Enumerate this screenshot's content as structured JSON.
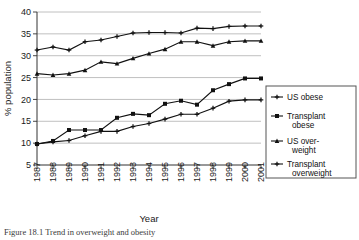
{
  "chart_data": {
    "type": "line",
    "title": "",
    "xlabel": "Year",
    "ylabel": "% population",
    "xlim": [
      1987,
      2001
    ],
    "ylim": [
      5,
      40
    ],
    "ytick_step": 5,
    "grid": true,
    "legend_position": "right",
    "x": [
      1987,
      1988,
      1989,
      1990,
      1991,
      1992,
      1993,
      1994,
      1995,
      1996,
      1997,
      1998,
      1999,
      2000,
      2001
    ],
    "categories": [
      "1987",
      "1988",
      "1989",
      "1990",
      "1991",
      "1992",
      "1993",
      "1994",
      "1995",
      "1996",
      "1997",
      "1998",
      "1999",
      "2000",
      "2001"
    ],
    "yticks": [
      5,
      10,
      15,
      20,
      25,
      30,
      35,
      40
    ],
    "ytick_labels": [
      "5",
      "10",
      "15",
      "20",
      "25",
      "30",
      "35",
      "40"
    ],
    "series": [
      {
        "name": "US obese",
        "marker": "plus",
        "values": [
          9.8,
          10.3,
          10.6,
          11.7,
          12.7,
          12.7,
          13.8,
          14.5,
          15.5,
          16.6,
          16.6,
          18.0,
          19.6,
          19.9,
          19.9
        ]
      },
      {
        "name": "Transplant obese",
        "marker": "square",
        "values": [
          9.8,
          10.5,
          13.0,
          13.0,
          13.0,
          15.8,
          16.7,
          16.4,
          19.0,
          19.7,
          18.8,
          22.1,
          23.5,
          24.8,
          24.8
        ]
      },
      {
        "name": "US overweight",
        "marker": "triangle",
        "values": [
          25.9,
          25.6,
          25.9,
          26.7,
          28.6,
          28.2,
          29.4,
          30.5,
          31.5,
          33.2,
          33.2,
          32.3,
          33.2,
          33.4,
          33.4
        ]
      },
      {
        "name": "Transplant overweight",
        "marker": "cross",
        "values": [
          31.3,
          32.0,
          31.3,
          33.2,
          33.6,
          34.4,
          35.2,
          35.3,
          35.3,
          35.2,
          36.3,
          36.2,
          36.7,
          36.8,
          36.8
        ]
      }
    ]
  },
  "legend": {
    "entries": [
      {
        "label": "US obese",
        "label_line2": ""
      },
      {
        "label": "Transplant",
        "label_line2": "obese"
      },
      {
        "label": "US over-",
        "label_line2": "weight"
      },
      {
        "label": "Transplant",
        "label_line2": "overweight"
      }
    ]
  },
  "axes": {
    "y_title": "% population",
    "x_title": "Year"
  },
  "caption": {
    "text": "Figure 18.1  Trend in overweight and obesity"
  },
  "colors": {
    "line": "#111111",
    "grid": "#b9b9b9",
    "axis": "#333333",
    "background": "#ffffff"
  }
}
